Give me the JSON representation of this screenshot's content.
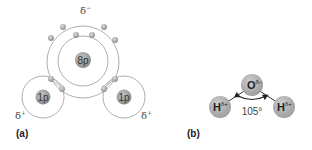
{
  "panel_a": {
    "label": "(a)",
    "oxygen_nucleus": "8p",
    "hydrogen_nuclei": [
      "1p",
      "1p"
    ],
    "oxygen_charge": "δ",
    "oxygen_charge_sup": "−",
    "hydrogen_charge": "δ",
    "hydrogen_charge_sup": "+",
    "inner_shell_electrons": 2,
    "outer_shell_electrons": 8
  },
  "panel_b": {
    "label": "(b)",
    "oxygen_symbol": "O",
    "oxygen_charge_sup": "δ−",
    "hydrogen_symbol": "H",
    "hydrogen_charge_sup": "δ+",
    "bond_angle": "105°"
  },
  "colors": {
    "nucleus": "#9a9a9a",
    "electron": "#b0b0b0",
    "shell_line": "#9c9c9c",
    "atom_b": "#a8a8a8"
  }
}
